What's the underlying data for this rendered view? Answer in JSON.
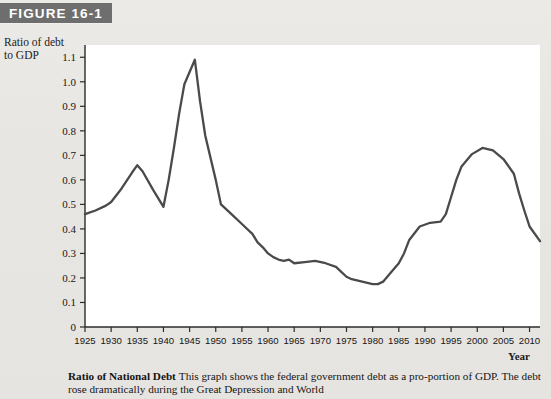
{
  "figure": {
    "badge_label": "FIGURE 16-1"
  },
  "axis": {
    "y_title_line1": "Ratio of debt",
    "y_title_line2": "to GDP",
    "x_title": "Year",
    "y_ticks": [
      "0",
      "0.1",
      "0.2",
      "0.3",
      "0.4",
      "0.5",
      "0.6",
      "0.7",
      "0.8",
      "0.9",
      "1.0",
      "1.1"
    ],
    "x_ticks": [
      "1925",
      "1930",
      "1935",
      "1940",
      "1945",
      "1950",
      "1955",
      "1960",
      "1965",
      "1970",
      "1975",
      "1980",
      "1985",
      "1990",
      "1995",
      "2000",
      "2005",
      "2010"
    ]
  },
  "caption": {
    "lead": "Ratio of National Debt",
    "body": "This graph shows the federal government debt as a pro-portion of GDP. The debt rose dramatically during the Great Depression and World"
  },
  "colors": {
    "badge_bg": "#6e6e6e",
    "badge_text": "#ffffff",
    "page_bg": "#e9e7e3",
    "plot_bg": "#ffffff",
    "line": "#4a4a4a",
    "axis": "#2b2b2b"
  },
  "chart_data": {
    "type": "line",
    "title": "Ratio of National Debt",
    "xlabel": "Year",
    "ylabel": "Ratio of debt to GDP",
    "xlim": [
      1925,
      2012
    ],
    "ylim": [
      0,
      1.15
    ],
    "grid": false,
    "legend": "none",
    "x": [
      1925,
      1927,
      1929,
      1930,
      1932,
      1934,
      1935,
      1936,
      1938,
      1940,
      1941,
      1942,
      1943,
      1944,
      1946,
      1947,
      1948,
      1950,
      1951,
      1953,
      1955,
      1957,
      1958,
      1959,
      1960,
      1961,
      1962,
      1963,
      1964,
      1965,
      1967,
      1969,
      1971,
      1973,
      1974,
      1975,
      1976,
      1978,
      1980,
      1981,
      1982,
      1983,
      1985,
      1986,
      1987,
      1989,
      1991,
      1993,
      1994,
      1995,
      1996,
      1997,
      1999,
      2001,
      2003,
      2005,
      2007,
      2008,
      2009,
      2010,
      2012
    ],
    "y": [
      0.46,
      0.475,
      0.495,
      0.51,
      0.565,
      0.63,
      0.66,
      0.635,
      0.56,
      0.49,
      0.6,
      0.73,
      0.87,
      0.99,
      1.09,
      0.92,
      0.78,
      0.6,
      0.5,
      0.46,
      0.42,
      0.38,
      0.345,
      0.325,
      0.3,
      0.285,
      0.275,
      0.27,
      0.275,
      0.26,
      0.265,
      0.27,
      0.26,
      0.245,
      0.225,
      0.205,
      0.195,
      0.185,
      0.175,
      0.175,
      0.185,
      0.21,
      0.26,
      0.3,
      0.355,
      0.41,
      0.425,
      0.43,
      0.46,
      0.53,
      0.6,
      0.655,
      0.705,
      0.73,
      0.72,
      0.685,
      0.625,
      0.545,
      0.475,
      0.41,
      0.35
    ],
    "key_points": [
      {
        "year": 1925,
        "value": 0.46,
        "note": "series start"
      },
      {
        "year": 1935,
        "value": 0.66,
        "note": "Great Depression peak"
      },
      {
        "year": 1940,
        "value": 0.49,
        "note": "pre-war trough"
      },
      {
        "year": 1946,
        "value": 1.09,
        "note": "World War II peak"
      },
      {
        "year": 1974,
        "value": 0.17,
        "note": "postwar minimum"
      },
      {
        "year": 1994,
        "value": 0.73,
        "note": "modern peak"
      },
      {
        "year": 2008,
        "value": 0.29,
        "note": "dip before flat tail"
      },
      {
        "year": 2012,
        "value": 0.32,
        "note": "series end"
      }
    ]
  }
}
